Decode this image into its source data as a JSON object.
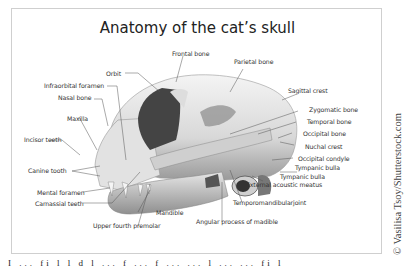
{
  "diagram": {
    "title": "Anatomy of the cat’s skull",
    "labels": {
      "frontal_bone": "Frontal bone",
      "parietal_bone": "Parietal bone",
      "orbit": "Orbit",
      "infraorbital_foramen": "Infraorbital foramen",
      "nasal_bone": "Nasal bone",
      "sagittal_crest": "Sagittal crest",
      "maxilla": "Maxilla",
      "zygomatic_bone": "Zygomatic bone",
      "temporal_bone": "Temporal bone",
      "incisor_teeth": "Incisor teeth",
      "occipital_bone": "Occipital bone",
      "nuchal_crest": "Nuchal crest",
      "canine_tooth": "Canine tooth",
      "occipital_condyle": "Occipital condyle",
      "tympanic_bulla_1": "Tympanic bulla",
      "tympanic_bulla_2": "Tympanic bulla",
      "external_acoustic_meatus": "External acoustic meatus",
      "mental_foramen": "Mental foramen",
      "carnassial_teeth": "Carnassial teeth",
      "temporomandibular_joint": "Temporomandibularjoint",
      "mandible": "Mandible",
      "upper_fourth_premolar": "Upper fourth premolar",
      "angular_process": "Angular process of madible"
    },
    "credit": "© Vasilisa Tsoy/Shutterstock.com",
    "bottom_text": "I  ...  fi  l l  d  l  ...  f  ...  f  ...  ...  l  ...  ...  fi  l"
  }
}
